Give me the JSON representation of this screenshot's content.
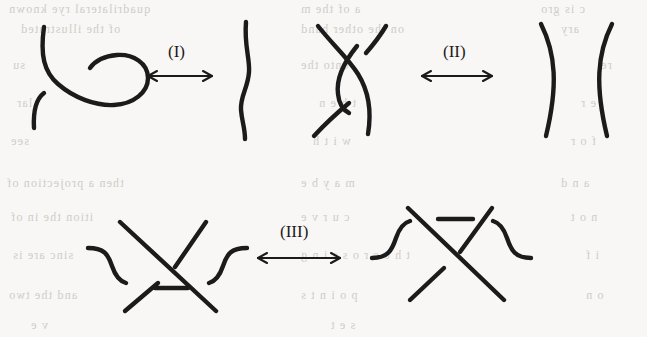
{
  "page": {
    "width": 647,
    "height": 337,
    "background_color": "#f8f7f5",
    "ink_color": "#1b1b1b",
    "bleed_text_color": "#c9c6c1"
  },
  "moves": [
    {
      "id": "move-1",
      "label": "(I)",
      "label_x": 168,
      "label_y": 42,
      "arrow": {
        "x1": 148,
        "x2": 212,
        "y": 76
      },
      "left_figure": "knot-curl-loop",
      "right_figure": "straight-wavy-strand",
      "description": "Twist / untwist a curl in a single strand"
    },
    {
      "id": "move-2",
      "label": "(II)",
      "label_x": 443,
      "label_y": 42,
      "arrow": {
        "x1": 422,
        "x2": 492,
        "y": 76
      },
      "left_figure": "two-strand-bigon-overlap",
      "right_figure": "two-separated-arcs",
      "description": "Slide one strand completely over another"
    },
    {
      "id": "move-3",
      "label": "(III)",
      "label_x": 280,
      "label_y": 222,
      "arrow": {
        "x1": 258,
        "x2": 340,
        "y": 258
      },
      "left_figure": "triangle-crossing-strand-below",
      "right_figure": "triangle-crossing-strand-above",
      "description": "Slide a strand completely past a crossing"
    }
  ],
  "bleed_text": [
    {
      "text": "quadrilateral  rye  known",
      "x": 8,
      "y": 2,
      "size": 12
    },
    {
      "text": "a   of   the   m",
      "x": 300,
      "y": 2,
      "size": 12
    },
    {
      "text": "c  is  gro",
      "x": 540,
      "y": 2,
      "size": 12
    },
    {
      "text": "of   the   illustrated",
      "x": 20,
      "y": 22,
      "size": 12
    },
    {
      "text": "on   the   other   hand",
      "x": 300,
      "y": 22,
      "size": 12
    },
    {
      "text": "ary",
      "x": 560,
      "y": 22,
      "size": 12
    },
    {
      "text": "su",
      "x": 12,
      "y": 58,
      "size": 12
    },
    {
      "text": "onto   the",
      "x": 300,
      "y": 58,
      "size": 12
    },
    {
      "text": "re",
      "x": 600,
      "y": 58,
      "size": 12
    },
    {
      "text": "lar",
      "x": 16,
      "y": 96,
      "size": 12
    },
    {
      "text": "t   h   e   n",
      "x": 318,
      "y": 96,
      "size": 12
    },
    {
      "text": "e   r",
      "x": 580,
      "y": 96,
      "size": 12
    },
    {
      "text": "see",
      "x": 10,
      "y": 134,
      "size": 12
    },
    {
      "text": "w   i   t   h",
      "x": 312,
      "y": 134,
      "size": 12
    },
    {
      "text": "f   o   r",
      "x": 570,
      "y": 134,
      "size": 12
    },
    {
      "text": "then  a  projection  of",
      "x": 6,
      "y": 176,
      "size": 12
    },
    {
      "text": "m   a   y    b   e",
      "x": 300,
      "y": 176,
      "size": 12
    },
    {
      "text": "a   n   d",
      "x": 560,
      "y": 176,
      "size": 12
    },
    {
      "text": "ition  the  in  of",
      "x": 10,
      "y": 210,
      "size": 12
    },
    {
      "text": "c   u   r   v   e",
      "x": 300,
      "y": 210,
      "size": 12
    },
    {
      "text": "n   o   t",
      "x": 570,
      "y": 210,
      "size": 12
    },
    {
      "text": "sinc   are   is",
      "x": 12,
      "y": 248,
      "size": 12
    },
    {
      "text": "t h e   c r o s s i n g",
      "x": 300,
      "y": 248,
      "size": 12
    },
    {
      "text": "i   f",
      "x": 585,
      "y": 248,
      "size": 12
    },
    {
      "text": "and   the   two",
      "x": 8,
      "y": 288,
      "size": 12
    },
    {
      "text": "p   o   i   n   t   s",
      "x": 300,
      "y": 288,
      "size": 12
    },
    {
      "text": "o   n",
      "x": 585,
      "y": 288,
      "size": 12
    },
    {
      "text": "v   e",
      "x": 30,
      "y": 318,
      "size": 12
    },
    {
      "text": "s   e   t",
      "x": 330,
      "y": 318,
      "size": 12
    }
  ]
}
